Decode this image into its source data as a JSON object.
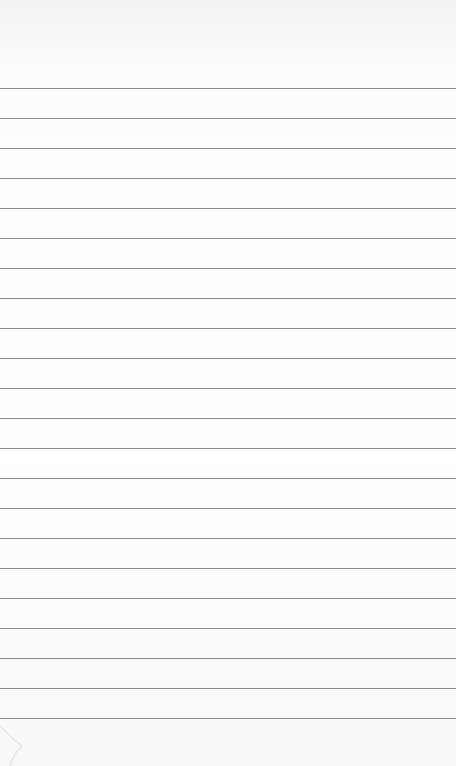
{
  "paper": {
    "type": "lined paper",
    "line_color": "#8a8a8a",
    "background": "#fdfdfd",
    "first_line_y": 88,
    "line_spacing": 30,
    "line_count": 22
  }
}
